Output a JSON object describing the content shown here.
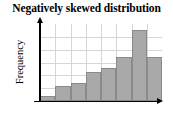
{
  "chart_data": {
    "type": "bar",
    "title": "Negatively skewed distribution",
    "xlabel": "",
    "ylabel": "Frequency",
    "categories": [
      "1",
      "2",
      "3",
      "4",
      "5",
      "6",
      "7",
      "8"
    ],
    "values": [
      7,
      20,
      24,
      38,
      43,
      57,
      92,
      57
    ],
    "ylim": [
      0,
      100
    ],
    "xlim": [
      0,
      8
    ],
    "grid": true,
    "grid_vertical_count": 7,
    "grid_horizontal_count": 5,
    "legend": false,
    "legend_position": "none",
    "tick_labels_x": [],
    "tick_labels_y": [],
    "annotations": [],
    "axis_arrows": true
  },
  "style": {
    "bar_fill": "#a9a9a9",
    "bar_stroke": "#8a8a8a",
    "grid_color": "#d6d6d6",
    "axis_color": "#000000",
    "background": "#ffffff",
    "title_color": "#000000"
  }
}
